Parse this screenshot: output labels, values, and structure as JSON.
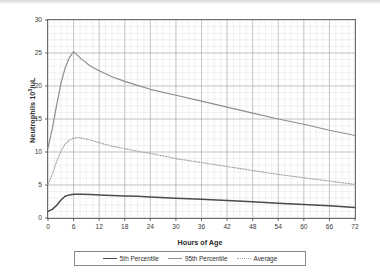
{
  "chart_data": {
    "type": "line",
    "title": "",
    "xlabel": "Hours of Age",
    "ylabel": "Neutrophils 10³/uL",
    "ylabel_base": "Neutrophils 10",
    "ylabel_exp": "3",
    "ylabel_unit": "/uL",
    "xlim": [
      0,
      72
    ],
    "ylim": [
      0,
      30
    ],
    "xticks": [
      0,
      6,
      12,
      18,
      24,
      30,
      36,
      42,
      48,
      54,
      60,
      66,
      72
    ],
    "yticks": [
      0,
      5,
      10,
      15,
      20,
      25,
      30
    ],
    "grid": true,
    "grid_minor_x": 1.5,
    "grid_minor_y": 1,
    "legend_position": "bottom",
    "x": [
      0,
      1,
      2,
      3,
      4,
      5,
      6,
      7,
      8,
      10,
      12,
      15,
      18,
      21,
      24,
      30,
      36,
      42,
      48,
      54,
      60,
      66,
      72
    ],
    "series": [
      {
        "name": "5th Percentile",
        "style": "solid",
        "color": "#4b4b4b",
        "values": [
          1.0,
          1.3,
          1.9,
          2.7,
          3.3,
          3.5,
          3.6,
          3.6,
          3.6,
          3.55,
          3.5,
          3.42,
          3.35,
          3.28,
          3.2,
          3.0,
          2.85,
          2.65,
          2.45,
          2.25,
          2.05,
          1.85,
          1.6
        ]
      },
      {
        "name": "95th Percentile",
        "style": "solid",
        "color": "#8e8e8e",
        "values": [
          10.6,
          13.5,
          17.0,
          20.3,
          22.7,
          24.3,
          25.2,
          24.6,
          24.0,
          23.0,
          22.3,
          21.4,
          20.7,
          20.1,
          19.5,
          18.6,
          17.7,
          16.8,
          15.9,
          15.0,
          14.2,
          13.3,
          12.5
        ]
      },
      {
        "name": "Average",
        "style": "dotted",
        "color": "#a6a6a6",
        "values": [
          5.1,
          6.6,
          8.5,
          10.1,
          11.2,
          11.8,
          12.1,
          12.2,
          12.1,
          11.8,
          11.4,
          10.9,
          10.5,
          10.1,
          9.8,
          9.0,
          8.4,
          7.8,
          7.2,
          6.6,
          6.1,
          5.6,
          5.1
        ]
      }
    ]
  },
  "legend": {
    "entries": [
      {
        "label": "5th Percentile"
      },
      {
        "label": "95th Percentile"
      },
      {
        "label": "Average"
      }
    ]
  }
}
